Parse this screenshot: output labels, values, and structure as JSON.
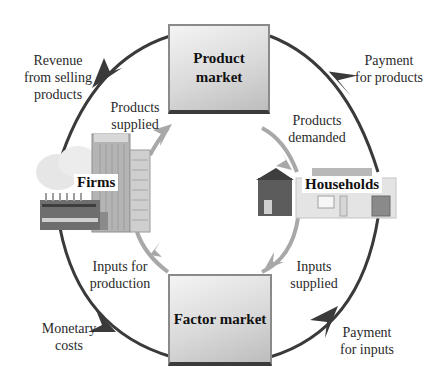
{
  "diagram": {
    "type": "circular-flow",
    "nodes": {
      "product_market": "Product\nmarket",
      "factor_market": "Factor market",
      "firms": "Firms",
      "households": "Households"
    },
    "flows": {
      "revenue": [
        "Revenue",
        "from selling",
        "products"
      ],
      "payment_products": [
        "Payment",
        "for products"
      ],
      "products_supplied": [
        "Products",
        "supplied"
      ],
      "products_demanded": [
        "Products",
        "demanded"
      ],
      "inputs_production": [
        "Inputs for",
        "production"
      ],
      "inputs_supplied": [
        "Inputs",
        "supplied"
      ],
      "monetary_costs": [
        "Monetary",
        "costs"
      ],
      "payment_inputs": [
        "Payment",
        "for inputs"
      ]
    },
    "colors": {
      "money_flow": "#3a3a3a",
      "goods_flow": "#a8a8a8",
      "box_border": "#8a8a8a"
    }
  }
}
